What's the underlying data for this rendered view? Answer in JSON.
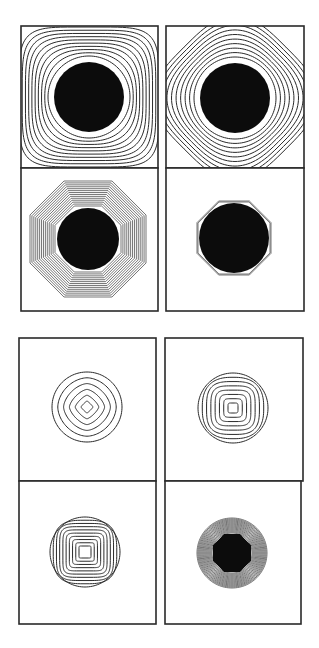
{
  "figure": {
    "width": 319,
    "height": 648,
    "background": "#ffffff",
    "line_color": "#2a2a2a",
    "fill_color": "#0c0c0c",
    "groups": [
      {
        "name": "top-group",
        "description": "Shrinking contours collapsing onto a disk",
        "panels": [
          {
            "id": "top-a",
            "x": 21,
            "y": 26,
            "w": 137,
            "h": 142,
            "cx": 89,
            "cy": 97,
            "shape": "rounded-square",
            "blob": "circle",
            "blob_r": 35,
            "contours": 10,
            "r_min": 41,
            "r_max": 70,
            "corner_exp": 5,
            "rotation": 0
          },
          {
            "id": "top-b",
            "x": 166,
            "y": 26,
            "w": 138,
            "h": 142,
            "cx": 235,
            "cy": 98,
            "shape": "rounded-diamond",
            "blob": "circle",
            "blob_r": 35,
            "contours": 10,
            "r_min": 41,
            "r_max": 72,
            "corner_exp": 3.2,
            "rotation": 45
          },
          {
            "id": "top-c",
            "x": 21,
            "y": 168,
            "w": 137,
            "h": 143,
            "cx": 88,
            "cy": 239,
            "shape": "octagon",
            "blob": "circle",
            "blob_r": 31,
            "contours": 14,
            "r_min": 33,
            "r_max": 58,
            "corner_exp": 0,
            "rotation": 22.5
          },
          {
            "id": "top-d",
            "x": 166,
            "y": 168,
            "w": 138,
            "h": 143,
            "cx": 234,
            "cy": 238,
            "shape": "octagon",
            "blob": "circle",
            "blob_r": 35,
            "contours": 2,
            "r_min": 36,
            "r_max": 37,
            "corner_exp": 0,
            "rotation": 22.5
          }
        ]
      },
      {
        "name": "bottom-group",
        "description": "Contours evolving inside a fixed circular boundary",
        "panels": [
          {
            "id": "bottom-a",
            "x": 19,
            "y": 338,
            "w": 137,
            "h": 143,
            "cx": 87,
            "cy": 407,
            "shape": "circle-to-diamond",
            "blob": "none",
            "blob_r": 0,
            "contours": 6,
            "r_min": 6,
            "r_max": 35,
            "corner_exp": 1,
            "rotation": 45
          },
          {
            "id": "bottom-b",
            "x": 165,
            "y": 338,
            "w": 138,
            "h": 143,
            "cx": 233,
            "cy": 408,
            "shape": "circle-to-square",
            "blob": "none",
            "blob_r": 0,
            "contours": 8,
            "r_min": 5,
            "r_max": 35,
            "corner_exp": 6,
            "rotation": 0
          },
          {
            "id": "bottom-c",
            "x": 19,
            "y": 481,
            "w": 137,
            "h": 143,
            "cx": 85,
            "cy": 552,
            "shape": "circle-to-square",
            "blob": "none",
            "blob_r": 0,
            "contours": 10,
            "r_min": 6,
            "r_max": 35,
            "corner_exp": 12,
            "rotation": 0
          },
          {
            "id": "bottom-d",
            "x": 165,
            "y": 481,
            "w": 136,
            "h": 143,
            "cx": 232,
            "cy": 553,
            "shape": "circle-dense",
            "blob": "octagon",
            "blob_r": 19,
            "contours": 16,
            "r_min": 20,
            "r_max": 35,
            "corner_exp": 0,
            "rotation": 22.5
          }
        ]
      }
    ]
  }
}
